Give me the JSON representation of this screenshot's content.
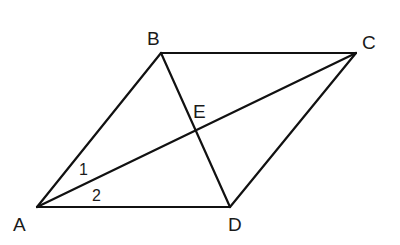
{
  "diagram": {
    "stroke_color": "#111111",
    "points": {
      "A": {
        "label": "A",
        "x": 37,
        "y": 207
      },
      "B": {
        "label": "B",
        "x": 161,
        "y": 53
      },
      "C": {
        "label": "C",
        "x": 356,
        "y": 53
      },
      "D": {
        "label": "D",
        "x": 230,
        "y": 207
      },
      "E": {
        "label": "E",
        "x": 194,
        "y": 127
      }
    },
    "segments": [
      "AB",
      "BC",
      "CD",
      "DA",
      "AC",
      "BD"
    ],
    "angle_labels": [
      {
        "label": "1",
        "between": "AB,AC"
      },
      {
        "label": "2",
        "between": "AC,AD"
      }
    ]
  }
}
